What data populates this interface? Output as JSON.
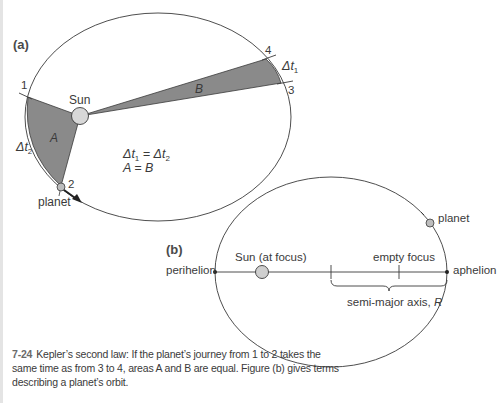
{
  "figure": {
    "panel_a": {
      "label": "(a)",
      "sun_label": "Sun",
      "planet_label": "planet",
      "point_labels": [
        "1",
        "2",
        "3",
        "4"
      ],
      "area_a_label": "A",
      "area_b_label": "B",
      "dt1_label": "Δt",
      "dt1_sub": "1",
      "dt2_label": "Δt",
      "dt2_sub": "2",
      "equation_line1_left": "Δt",
      "equation_line1_sub1": "1",
      "equation_line1_mid": " = Δt",
      "equation_line1_sub2": "2",
      "equation_line2": "A = B"
    },
    "panel_b": {
      "label": "(b)",
      "sun_label": "Sun (at focus)",
      "empty_focus_label": "empty focus",
      "perihelion_label": "perihelion",
      "aphelion_label": "aphelion",
      "planet_label": "planet",
      "semi_major_label": "semi-major axis, ",
      "semi_major_symbol": "R"
    },
    "colors": {
      "line": "#3a3a3a",
      "area_fill": "#8a8a8a",
      "sun_fill": "#d8d8d8",
      "planet_fill": "#bdbdbd"
    }
  },
  "caption": {
    "number": "7-24",
    "text": "Kepler’s second law: If the planet’s journey from 1 to 2 takes the same time as from 3 to 4, areas A and B are equal. Figure (b) gives terms describing a planet’s orbit."
  }
}
